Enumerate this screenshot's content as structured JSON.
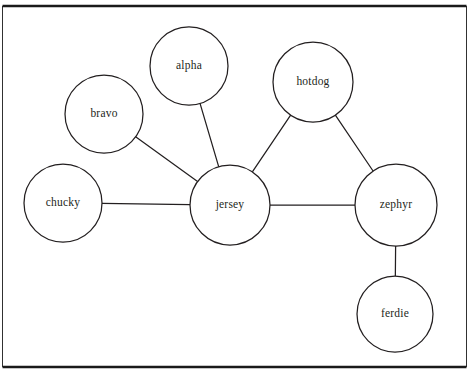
{
  "diagram": {
    "background_color": "#ffffff",
    "stroke_color": "#231f20",
    "frame": {
      "top_rule_y": 6,
      "bottom_rule_y": 367,
      "left_rule_x": 2.5,
      "right_rule_x": 466.5,
      "rule_color": "#1a1a1a"
    },
    "nodes": [
      {
        "id": "alpha",
        "label": "alpha",
        "cx": 189,
        "cy": 66,
        "r": 39
      },
      {
        "id": "bravo",
        "label": "bravo",
        "cx": 104,
        "cy": 114,
        "r": 39
      },
      {
        "id": "hotdog",
        "label": "hotdog",
        "cx": 313,
        "cy": 82,
        "r": 40
      },
      {
        "id": "chucky",
        "label": "chucky",
        "cx": 63,
        "cy": 203,
        "r": 39
      },
      {
        "id": "jersey",
        "label": "jersey",
        "cx": 230,
        "cy": 205,
        "r": 40
      },
      {
        "id": "zephyr",
        "label": "zephyr",
        "cx": 396,
        "cy": 205,
        "r": 41
      },
      {
        "id": "ferdie",
        "label": "ferdie",
        "cx": 395,
        "cy": 314,
        "r": 38
      }
    ],
    "edges": [
      {
        "id": "alpha-jersey",
        "source": "alpha",
        "target": "jersey"
      },
      {
        "id": "bravo-jersey",
        "source": "bravo",
        "target": "jersey"
      },
      {
        "id": "chucky-jersey",
        "source": "chucky",
        "target": "jersey"
      },
      {
        "id": "hotdog-jersey",
        "source": "hotdog",
        "target": "jersey"
      },
      {
        "id": "hotdog-zephyr",
        "source": "hotdog",
        "target": "zephyr"
      },
      {
        "id": "jersey-zephyr",
        "source": "jersey",
        "target": "zephyr"
      },
      {
        "id": "zephyr-ferdie",
        "source": "zephyr",
        "target": "ferdie"
      }
    ]
  }
}
